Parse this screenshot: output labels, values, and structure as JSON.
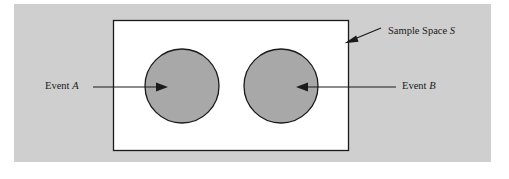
{
  "figure": {
    "type": "venn-diagram",
    "background_color": "#cfcfcf",
    "page_color": "#ffffff",
    "sample_space": {
      "shape": "rectangle",
      "fill_color": "#ffffff",
      "stroke_color": "#1a1a1a",
      "label_prefix": "Sample Space ",
      "label_symbol": "S",
      "label_full": "Sample Space S",
      "pointer": "arrow"
    },
    "events": [
      {
        "id": "A",
        "shape": "circle",
        "fill_color": "#a8a8a8",
        "stroke_color": "#1a1a1a",
        "label_prefix": "Event ",
        "label_symbol": "A",
        "label_full": "Event A",
        "pointer": "arrow-right"
      },
      {
        "id": "B",
        "shape": "circle",
        "fill_color": "#a8a8a8",
        "stroke_color": "#1a1a1a",
        "label_prefix": "Event ",
        "label_symbol": "B",
        "label_full": "Event B",
        "pointer": "arrow-left"
      }
    ]
  }
}
